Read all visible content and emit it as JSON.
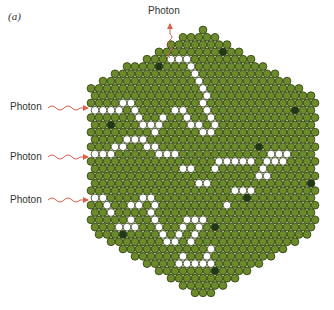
{
  "figure": {
    "panel_label": "(a)",
    "colors": {
      "cell_fill": "#6b8a2a",
      "cell_stroke": "#2e3d0f",
      "dark_cell_fill": "#1f3a14",
      "path_fill": "#ffffff",
      "arrow": "#d9604a",
      "text": "#333333"
    },
    "photons": {
      "top": {
        "label": "Photon",
        "direction": "outgoing"
      },
      "left": [
        {
          "label": "Photon",
          "direction": "incoming"
        },
        {
          "label": "Photon",
          "direction": "incoming"
        },
        {
          "label": "Photon",
          "direction": "incoming"
        }
      ]
    },
    "lattice": {
      "shape": "hexagon",
      "cell": "circle",
      "description": "Hexagonal close-packed lattice of green cells; white cells trace random-walk photon paths; dark cells scattered"
    }
  }
}
